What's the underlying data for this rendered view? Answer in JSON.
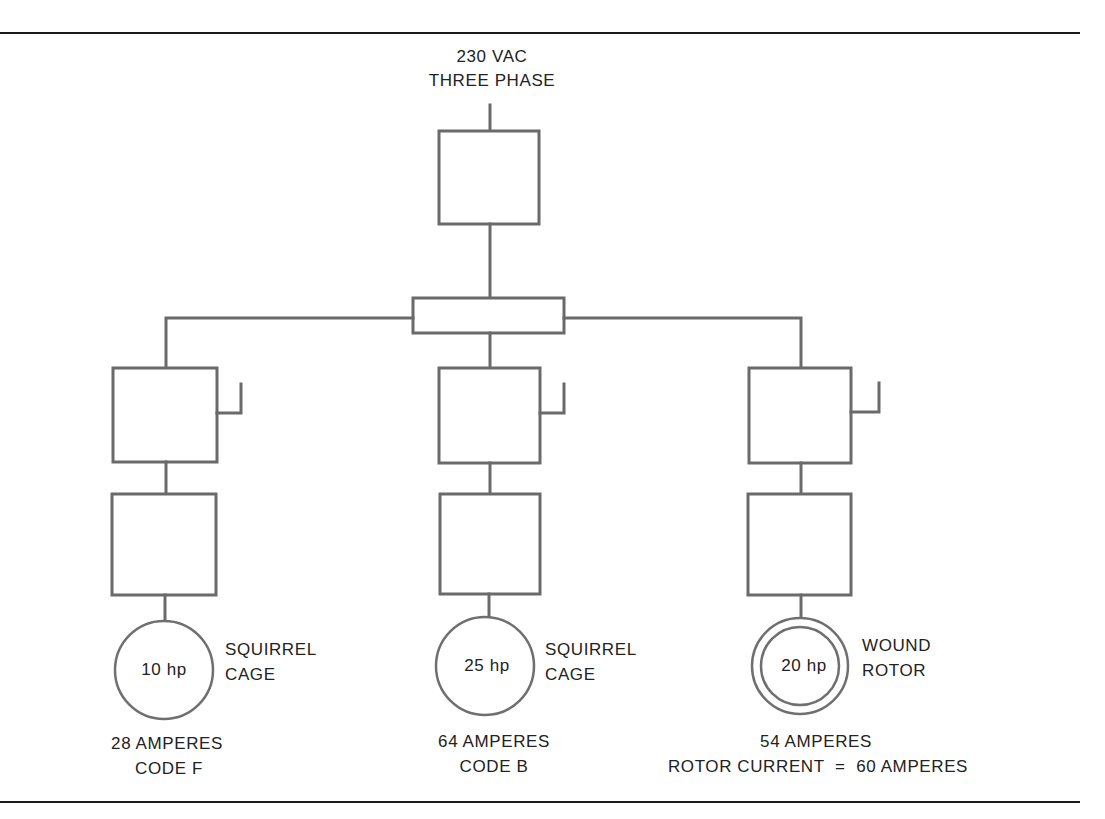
{
  "supply": {
    "line1": "230 VAC",
    "line2": "THREE PHASE"
  },
  "motors": [
    {
      "hp": "10 hp",
      "type_line1": "SQUIRREL",
      "type_line2": "CAGE",
      "current_line1": "28 AMPERES",
      "current_line2": "CODE F",
      "winding": "single"
    },
    {
      "hp": "25 hp",
      "type_line1": "SQUIRREL",
      "type_line2": "CAGE",
      "current_line1": "64 AMPERES",
      "current_line2": "CODE B",
      "winding": "single"
    },
    {
      "hp": "20 hp",
      "type_line1": "WOUND",
      "type_line2": "ROTOR",
      "current_line1": "54 AMPERES",
      "current_line2": "ROTOR CURRENT  =  60 AMPERES",
      "winding": "double"
    }
  ],
  "colors": {
    "line": "#6a6a6a",
    "rule": "#1a1a1a",
    "text": "#222222",
    "background": "#ffffff"
  }
}
